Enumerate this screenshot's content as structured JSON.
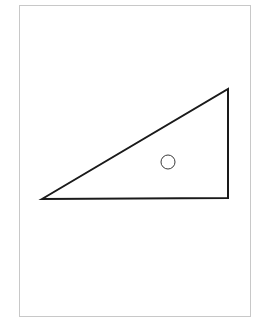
{
  "figure": {
    "frame": {
      "x": 19.5,
      "y": 5.5,
      "width": 231,
      "height": 311,
      "stroke": "#c8c8c8",
      "stroke_width": 1
    },
    "triangle": {
      "points": [
        [
          42,
          199
        ],
        [
          228,
          89
        ],
        [
          228,
          198
        ]
      ],
      "stroke": "#1a1a1a",
      "stroke_width": 2,
      "fill": "none"
    },
    "circle": {
      "cx": 168,
      "cy": 162,
      "r": 7,
      "stroke": "#3a3a3a",
      "stroke_width": 1,
      "fill": "none"
    }
  }
}
